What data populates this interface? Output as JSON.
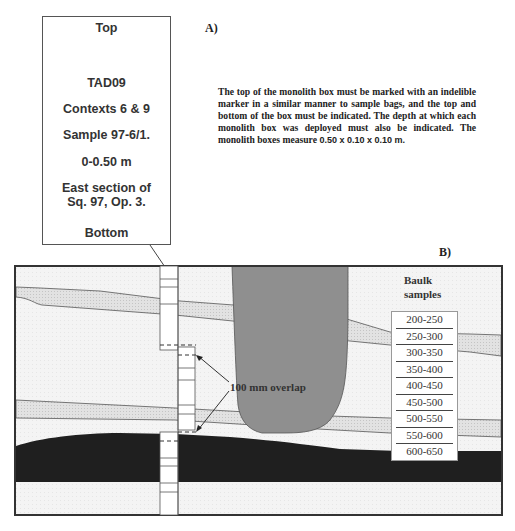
{
  "panel_a": {
    "letter": "A)",
    "label_card": {
      "top": "Top",
      "site_code": "TAD09",
      "contexts": "Contexts 6 & 9",
      "sample": "Sample 97-6/1.",
      "depth": "0-0.50 m",
      "location_line1": "East section of",
      "location_line2": "Sq. 97, Op. 3.",
      "bottom": "Bottom"
    },
    "note": {
      "text": "The top of the monolith box must be marked with an indelible marker in a similar manner to sample bags, and the top and bottom of the box must be indicated. The depth at which each monolith box was deployed must also be indicated. The monolith boxes measure",
      "dimensions": "0.50 x 0.10 x 0.10 m."
    }
  },
  "panel_b": {
    "letter": "B)",
    "overlap_label": "100 mm overlap",
    "baulk": {
      "title_line1": "Baulk",
      "title_line2": "samples",
      "samples": [
        "200-250",
        "250-300",
        "300-350",
        "350-400",
        "400-450",
        "450-500",
        "500-550",
        "550-600",
        "600-650"
      ]
    },
    "colors": {
      "background_layer": "#f2f2f2",
      "stippled_layer": "#dcdcdc",
      "pit_fill": "#8c8c8c",
      "dark_layer": "#1e1e1e",
      "frame": "#333333"
    }
  }
}
